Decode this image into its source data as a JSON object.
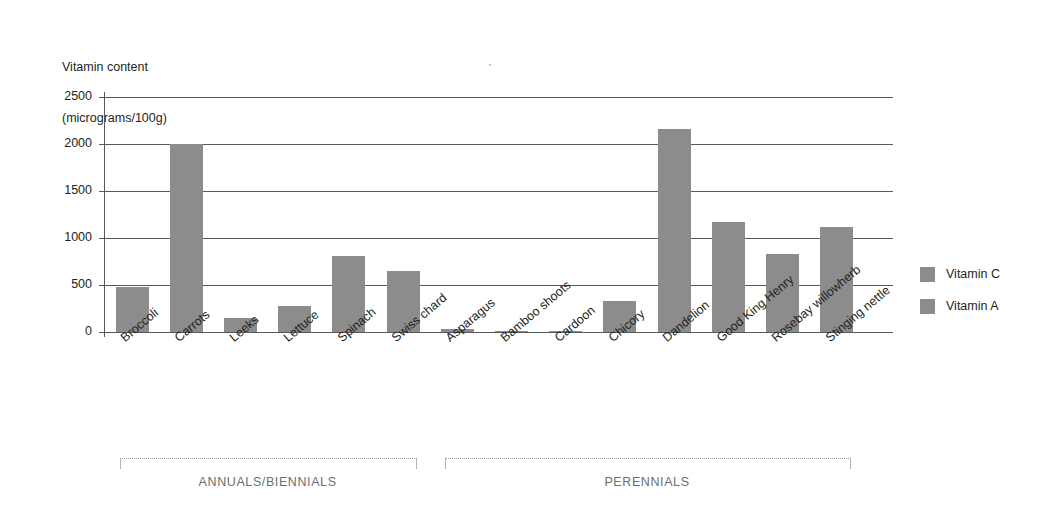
{
  "chart_data": {
    "type": "bar",
    "title": "",
    "ylabel_lines": [
      "Vitamin content",
      "(micrograms/100g)"
    ],
    "xlabel": "",
    "ylim": [
      0,
      2500
    ],
    "yticks": [
      0,
      500,
      1000,
      1500,
      2000,
      2500
    ],
    "ytick_labels": [
      "0",
      "500",
      "1000",
      "1500",
      "2000",
      "2500"
    ],
    "grid": true,
    "legend_position": "right",
    "legend": [
      "Vitamin C",
      "Vitamin A"
    ],
    "categories": [
      "Broccoli",
      "Carrots",
      "Leeks",
      "Lettuce",
      "Spinach",
      "Swiss chard",
      "Asparagus",
      "Bamboo shoots",
      "Cardoon",
      "Chicory",
      "Dandelion",
      "Good King Henry",
      "Rosebay willowherb",
      "Stinging nettle"
    ],
    "values": [
      480,
      2005,
      150,
      280,
      805,
      650,
      33,
      15,
      12,
      325,
      2165,
      1170,
      825,
      1115
    ],
    "series": [
      {
        "name": "Vitamin C",
        "values": [
          480,
          2005,
          150,
          280,
          805,
          650,
          33,
          15,
          12,
          325,
          2165,
          1170,
          825,
          1115
        ]
      }
    ],
    "groups": [
      {
        "label": "ANNUALS/BIENNIALS",
        "start_index": 0,
        "end_index": 5
      },
      {
        "label": "PERENNIALS",
        "start_index": 6,
        "end_index": 13
      }
    ],
    "colors": {
      "bar": "#8c8c8c",
      "grid": "#58595b",
      "text": "#231f20",
      "group_label": "#6d6e71",
      "bracket": "#b3b3b3"
    }
  }
}
